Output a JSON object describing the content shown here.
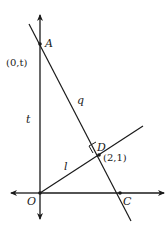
{
  "diagram": {
    "points": {
      "A": {
        "label": "A",
        "coord_label": "(0,t)"
      },
      "D": {
        "label": "D",
        "coord_label": "(2,1)"
      },
      "O": {
        "label": "O"
      },
      "C": {
        "label": "C"
      }
    },
    "segments": {
      "q": {
        "label": "q"
      },
      "t": {
        "label": "t"
      },
      "l": {
        "label": "l"
      }
    },
    "colors": {
      "stroke": "#1a1a1a",
      "background": "#ffffff"
    }
  }
}
